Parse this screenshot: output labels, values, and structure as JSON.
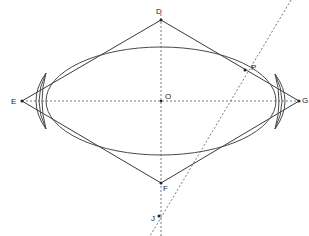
{
  "diagram": {
    "type": "geometry-construction",
    "points": [
      {
        "name": "D",
        "x": 161,
        "y": 20,
        "label_x": 156,
        "label_y": 14
      },
      {
        "name": "E",
        "x": 22,
        "y": 101,
        "label_x": 11,
        "label_y": 104
      },
      {
        "name": "F",
        "x": 161,
        "y": 183,
        "label_x": 163,
        "label_y": 191
      },
      {
        "name": "G",
        "x": 299,
        "y": 101,
        "label_x": 302,
        "label_y": 103
      },
      {
        "name": "O",
        "x": 161,
        "y": 101,
        "label_x": 165,
        "label_y": 99
      },
      {
        "name": "P",
        "x": 245,
        "y": 70,
        "label_x": 251,
        "label_y": 70
      },
      {
        "name": "J",
        "x": 159,
        "y": 216,
        "label_x": 151,
        "label_y": 221
      }
    ],
    "labels": {
      "D": "D",
      "E": "E",
      "F": "F",
      "G": "G",
      "O": "O",
      "P": "P",
      "J": "J"
    },
    "colors": {
      "line": "#3a3a3a",
      "dashed": "#555555",
      "background": "#ffffff"
    }
  }
}
